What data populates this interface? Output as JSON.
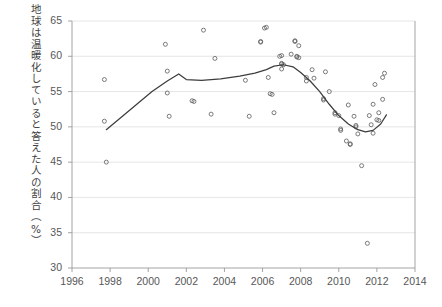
{
  "chart_data": {
    "type": "scatter",
    "title": "",
    "subtitle": "",
    "xlabel": "",
    "ylabel": "地球は温暖化していると答えた人の割合（%）",
    "xlim": [
      1996,
      2014
    ],
    "ylim": [
      30,
      65
    ],
    "xticks": [
      1996,
      1998,
      2000,
      2002,
      2004,
      2006,
      2008,
      2010,
      2012,
      2014
    ],
    "yticks": [
      30,
      35,
      40,
      45,
      50,
      55,
      60,
      65
    ],
    "xtick_labels": [
      "1996",
      "1998",
      "2000",
      "2002",
      "2004",
      "2006",
      "2008",
      "2010",
      "2012",
      "2014"
    ],
    "ytick_labels": [
      "30",
      "35",
      "40",
      "45",
      "50",
      "55",
      "60",
      "65"
    ],
    "grid": "horizontal",
    "legend": "none",
    "marker_style": "open-circle",
    "series": [
      {
        "name": "survey-responses",
        "type": "scatter",
        "points": [
          [
            1997.7,
            56.7
          ],
          [
            1997.7,
            50.8
          ],
          [
            1997.8,
            45.0
          ],
          [
            2000.9,
            61.7
          ],
          [
            2001.0,
            57.9
          ],
          [
            2001.0,
            54.8
          ],
          [
            2001.1,
            51.5
          ],
          [
            2002.3,
            53.7
          ],
          [
            2002.4,
            53.6
          ],
          [
            2002.9,
            63.7
          ],
          [
            2003.3,
            51.8
          ],
          [
            2003.5,
            59.7
          ],
          [
            2005.1,
            56.6
          ],
          [
            2005.3,
            51.5
          ],
          [
            2005.9,
            62.0
          ],
          [
            2005.9,
            62.1
          ],
          [
            2006.1,
            64.0
          ],
          [
            2006.2,
            64.1
          ],
          [
            2006.3,
            57.0
          ],
          [
            2006.4,
            54.7
          ],
          [
            2006.5,
            54.6
          ],
          [
            2006.6,
            52.0
          ],
          [
            2006.9,
            60.0
          ],
          [
            2007.0,
            60.1
          ],
          [
            2007.0,
            58.9
          ],
          [
            2007.0,
            59.0
          ],
          [
            2007.0,
            58.2
          ],
          [
            2007.1,
            58.8
          ],
          [
            2007.5,
            60.3
          ],
          [
            2007.7,
            62.1
          ],
          [
            2007.7,
            62.2
          ],
          [
            2007.8,
            59.9
          ],
          [
            2007.8,
            60.0
          ],
          [
            2007.9,
            61.5
          ],
          [
            2007.9,
            59.8
          ],
          [
            2008.3,
            57.0
          ],
          [
            2008.3,
            56.5
          ],
          [
            2008.6,
            58.1
          ],
          [
            2008.7,
            56.9
          ],
          [
            2009.2,
            54.0
          ],
          [
            2009.2,
            53.8
          ],
          [
            2009.3,
            57.8
          ],
          [
            2009.5,
            55.0
          ],
          [
            2009.8,
            52.0
          ],
          [
            2009.8,
            51.8
          ],
          [
            2010.0,
            51.6
          ],
          [
            2010.1,
            49.7
          ],
          [
            2010.1,
            49.5
          ],
          [
            2010.4,
            48.0
          ],
          [
            2010.5,
            53.1
          ],
          [
            2010.6,
            47.5
          ],
          [
            2010.6,
            47.6
          ],
          [
            2010.8,
            51.5
          ],
          [
            2010.9,
            50.2
          ],
          [
            2010.9,
            50.0
          ],
          [
            2011.0,
            49.0
          ],
          [
            2011.2,
            44.5
          ],
          [
            2011.5,
            33.5
          ],
          [
            2011.6,
            51.6
          ],
          [
            2011.7,
            50.3
          ],
          [
            2011.8,
            49.1
          ],
          [
            2011.8,
            53.2
          ],
          [
            2011.9,
            56.0
          ],
          [
            2012.0,
            51.0
          ],
          [
            2012.1,
            50.9
          ],
          [
            2012.1,
            52.0
          ],
          [
            2012.3,
            57.0
          ],
          [
            2012.3,
            53.9
          ],
          [
            2012.4,
            57.6
          ]
        ]
      },
      {
        "name": "trend-line",
        "type": "line",
        "points": [
          [
            1997.8,
            49.6
          ],
          [
            1998.6,
            51.4
          ],
          [
            1999.4,
            53.2
          ],
          [
            2000.2,
            55.0
          ],
          [
            2001.0,
            56.5
          ],
          [
            2001.6,
            57.5
          ],
          [
            2002.0,
            56.7
          ],
          [
            2002.8,
            56.6
          ],
          [
            2003.8,
            56.8
          ],
          [
            2004.8,
            57.2
          ],
          [
            2005.6,
            57.6
          ],
          [
            2006.2,
            58.1
          ],
          [
            2006.6,
            58.6
          ],
          [
            2007.1,
            58.8
          ],
          [
            2007.6,
            58.5
          ],
          [
            2008.0,
            57.7
          ],
          [
            2008.5,
            56.5
          ],
          [
            2009.0,
            55.0
          ],
          [
            2009.5,
            53.2
          ],
          [
            2010.0,
            51.6
          ],
          [
            2010.5,
            50.4
          ],
          [
            2011.0,
            49.6
          ],
          [
            2011.4,
            49.3
          ],
          [
            2011.8,
            49.5
          ],
          [
            2012.2,
            50.4
          ],
          [
            2012.5,
            51.7
          ]
        ]
      }
    ]
  },
  "axis": {
    "y_label_text": "地球は温暖化していると答えた人の割合（%）"
  }
}
